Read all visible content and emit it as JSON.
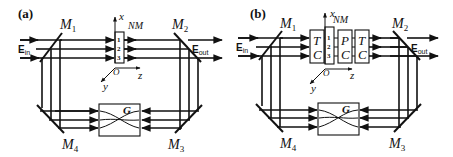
{
  "figure": {
    "panels": [
      {
        "id": "a",
        "label": "(a)",
        "mirrors": [
          {
            "name": "M",
            "sub": "1"
          },
          {
            "name": "M",
            "sub": "2"
          },
          {
            "name": "M",
            "sub": "3"
          },
          {
            "name": "M",
            "sub": "4"
          }
        ],
        "input_label": {
          "name": "E",
          "sub": "in"
        },
        "output_label": {
          "name": "E",
          "sub": "out"
        },
        "axes": {
          "x": "x",
          "y": "y",
          "z": "z",
          "origin": "O"
        },
        "nm_label": "NM",
        "channels": [
          "1",
          "2",
          "3"
        ],
        "element_g": "G",
        "blocks": []
      },
      {
        "id": "b",
        "label": "(b)",
        "mirrors": [
          {
            "name": "M",
            "sub": "1"
          },
          {
            "name": "M",
            "sub": "2"
          },
          {
            "name": "M",
            "sub": "3"
          },
          {
            "name": "M",
            "sub": "4"
          }
        ],
        "input_label": {
          "name": "E",
          "sub": "in"
        },
        "output_label": {
          "name": "E",
          "sub": "out"
        },
        "axes": {
          "x": "x",
          "y": "y",
          "z": "z",
          "origin": "O"
        },
        "nm_label": "NM",
        "channels": [
          "1",
          "2",
          "3"
        ],
        "element_g": "G",
        "blocks": [
          {
            "top": "T",
            "bottom": "C"
          },
          {
            "top": "P",
            "bottom": "C"
          },
          {
            "top": "T",
            "bottom": "C"
          }
        ]
      }
    ]
  }
}
